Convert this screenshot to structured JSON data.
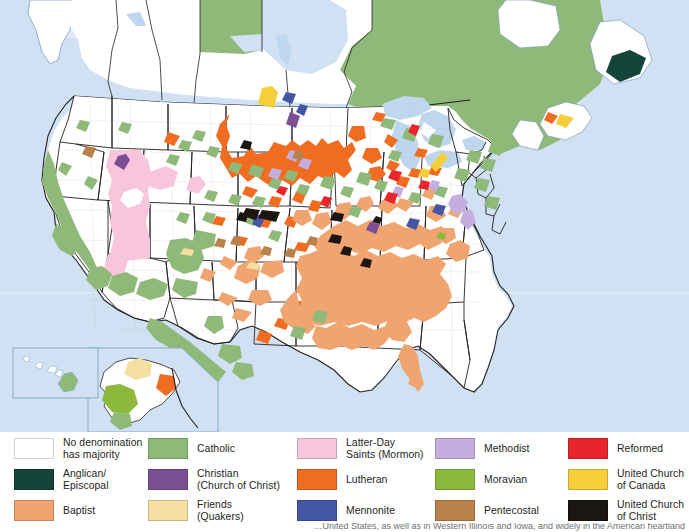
{
  "map": {
    "ocean_color": "#cfe1f2",
    "lake_color": "#bed7ee",
    "land_default_color": "#ffffff",
    "border_color": "#231f20",
    "county_border_color": "#8c8c8c",
    "inset_border_color": "#7fa8c9",
    "insets": [
      {
        "name": "hawaii-inset"
      },
      {
        "name": "alaska-inset"
      }
    ]
  },
  "legend": {
    "columns": [
      {
        "name": "legend-column-1",
        "items": [
          {
            "label": "No denomination\nhas majority",
            "color": "#ffffff",
            "key": "no-denomination-has-majority"
          },
          {
            "label": "Anglican/\nEpiscopal",
            "color": "#15453a",
            "key": "anglican-episcopal"
          },
          {
            "label": "Baptist",
            "color": "#f0a571",
            "key": "baptist"
          }
        ]
      },
      {
        "name": "legend-column-2",
        "items": [
          {
            "label": "Catholic",
            "color": "#8fb979",
            "key": "catholic"
          },
          {
            "label": "Christian\n(Church of Christ)",
            "color": "#7c4f95",
            "key": "christian-church-of-christ"
          },
          {
            "label": "Friends\n(Quakers)",
            "color": "#f5dfa0",
            "key": "friends-quakers"
          }
        ]
      },
      {
        "name": "legend-column-3",
        "items": [
          {
            "label": "Latter-Day\nSaints (Mormon)",
            "color": "#f7c6dc",
            "key": "latter-day-saints-mormon"
          },
          {
            "label": "Lutheran",
            "color": "#ef6c20",
            "key": "lutheran"
          },
          {
            "label": "Mennonite",
            "color": "#4457a5",
            "key": "mennonite"
          }
        ]
      },
      {
        "name": "legend-column-4",
        "items": [
          {
            "label": "Methodist",
            "color": "#c3aedd",
            "key": "methodist"
          },
          {
            "label": "Moravian",
            "color": "#8cb93b",
            "key": "moravian"
          },
          {
            "label": "Pentecostal",
            "color": "#b9814c",
            "key": "pentecostal"
          }
        ]
      },
      {
        "name": "legend-column-5",
        "items": [
          {
            "label": "Reformed",
            "color": "#e8252b",
            "key": "reformed"
          },
          {
            "label": "United Church\nof Canada",
            "color": "#f5cf3a",
            "key": "united-church-of-canada"
          },
          {
            "label": "United Church\nof Christ",
            "color": "#1a1612",
            "key": "united-church-of-christ"
          }
        ]
      }
    ]
  },
  "caption": {
    "text": "…United States, as well as in Western Illinois and Iowa, and widely in the American heartland"
  }
}
